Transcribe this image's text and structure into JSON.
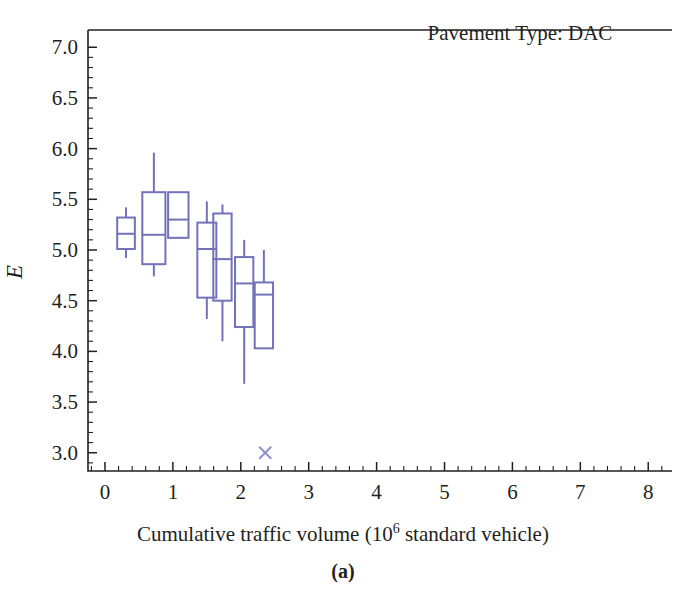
{
  "figure": {
    "caption": "(a)",
    "annotation": "Pavement Type: DAC"
  },
  "chart_data": {
    "type": "box",
    "title": "Pavement Type: DAC",
    "xlabel_prefix": "Cumulative traffic volume (10",
    "xlabel_sup": "6",
    "xlabel_suffix": " standard vehicle)",
    "ylabel": "E",
    "xlim": [
      -0.25,
      8.35
    ],
    "ylim": [
      2.82,
      7.17
    ],
    "xticks": [
      0,
      1,
      2,
      3,
      4,
      5,
      6,
      7,
      8
    ],
    "xtick_labels": [
      "0",
      "1",
      "2",
      "3",
      "4",
      "5",
      "6",
      "7",
      "8"
    ],
    "yticks": [
      3.0,
      3.5,
      4.0,
      4.5,
      5.0,
      5.5,
      6.0,
      6.5,
      7.0
    ],
    "ytick_labels": [
      "3.0",
      "3.5",
      "4.0",
      "4.5",
      "5.0",
      "5.5",
      "6.0",
      "6.5",
      "7.0"
    ],
    "x_minor_per_major": 5,
    "y_minor_per_major": 5,
    "grid": false,
    "legend": "none",
    "box_color": "#7272ba",
    "axis_color": "#231f20",
    "boxes": [
      {
        "label": "box-1",
        "x": 0.31,
        "width": 0.26,
        "whisker_low": 4.92,
        "q1": 5.01,
        "median": 5.16,
        "q3": 5.32,
        "whisker_high": 5.42
      },
      {
        "label": "box-2",
        "x": 0.72,
        "width": 0.34,
        "whisker_low": 4.74,
        "q1": 4.86,
        "median": 5.15,
        "q3": 5.57,
        "whisker_high": 5.96
      },
      {
        "label": "box-3",
        "x": 1.08,
        "width": 0.3,
        "whisker_low": 5.12,
        "q1": 5.12,
        "median": 5.3,
        "q3": 5.57,
        "whisker_high": 5.57
      },
      {
        "label": "box-4",
        "x": 1.5,
        "width": 0.28,
        "whisker_low": 4.32,
        "q1": 4.53,
        "median": 5.01,
        "q3": 5.27,
        "whisker_high": 5.48
      },
      {
        "label": "box-5",
        "x": 1.73,
        "width": 0.27,
        "whisker_low": 4.1,
        "q1": 4.5,
        "median": 4.91,
        "q3": 5.36,
        "whisker_high": 5.45
      },
      {
        "label": "box-6",
        "x": 2.05,
        "width": 0.27,
        "whisker_low": 3.68,
        "q1": 4.24,
        "median": 4.67,
        "q3": 4.93,
        "whisker_high": 5.1
      },
      {
        "label": "box-7",
        "x": 2.34,
        "width": 0.27,
        "whisker_low": 4.03,
        "q1": 4.03,
        "median": 4.56,
        "q3": 4.68,
        "whisker_high": 5.0
      }
    ],
    "outliers": [
      {
        "label": "outlier-1",
        "x": 2.36,
        "y": 3.0,
        "marker": "x"
      }
    ]
  }
}
